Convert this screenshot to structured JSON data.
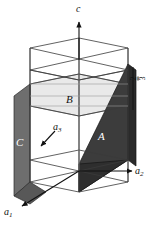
{
  "figure": {
    "type": "crystallographic-unit-cell-diagram",
    "background_color": "#ffffff",
    "line_color": "#333333",
    "edge_color": "#111111"
  },
  "axes": [
    {
      "id": "c",
      "label": "c",
      "subscript": "",
      "arrow_direction": "up",
      "x": 79,
      "y": 9
    },
    {
      "id": "a2",
      "label": "a",
      "subscript": "2",
      "arrow_direction": "right",
      "x": 138,
      "y": 174
    },
    {
      "id": "a3",
      "label": "a",
      "subscript": "3",
      "arrow_direction": "down-left",
      "x": 39,
      "y": 133
    },
    {
      "id": "a1",
      "label": "a",
      "subscript": "1",
      "arrow_direction": "down-left",
      "x": 7,
      "y": 212
    }
  ],
  "planes": [
    {
      "id": "A",
      "label": "A",
      "shade": "dark",
      "color": "#3a3a3a",
      "text_color": "#ffffff",
      "x": 101,
      "y": 138
    },
    {
      "id": "B",
      "label": "B",
      "shade": "light",
      "color": "#e8e8e8",
      "text_color": "#111111",
      "x": 69,
      "y": 101
    },
    {
      "id": "C",
      "label": "C",
      "shade": "mid",
      "color": "#6e6e6e",
      "text_color": "#ffffff",
      "x": 19,
      "y": 144
    }
  ],
  "annotations": [
    {
      "id": "intercept-two-thirds",
      "numerator": "2",
      "denominator": "3",
      "rotated": true,
      "x": 141,
      "y": 78
    }
  ],
  "colors": {
    "plane_dark": "#3a3a3a",
    "plane_mid": "#6e6e6e",
    "plane_light": "#e8e8e8",
    "outline": "#333333",
    "outline_strong": "#111111",
    "background": "#ffffff"
  }
}
